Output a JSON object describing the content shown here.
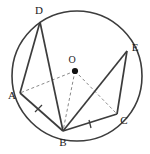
{
  "figure": {
    "background_color": "#ffffff",
    "stroke_color": "#3c3c3c",
    "dashed_color": "#8a8a8a",
    "label_color": "#1a1a1a",
    "circle": {
      "name": "circle-outline",
      "cx": 77,
      "cy": 76,
      "r": 65,
      "stroke_width": 1.6
    },
    "center_point": {
      "name": "center-point-o",
      "label": "O",
      "x": 75,
      "y": 71,
      "label_x": 72,
      "label_y": 61,
      "dot_radius": 3.1
    },
    "points": [
      {
        "id": "A",
        "label": "A",
        "x": 20,
        "y": 93,
        "label_x": 12,
        "label_y": 96
      },
      {
        "id": "B",
        "label": "B",
        "x": 63,
        "y": 131,
        "label_x": 63,
        "label_y": 143
      },
      {
        "id": "C",
        "label": "C",
        "x": 117,
        "y": 114,
        "label_x": 124,
        "label_y": 121
      },
      {
        "id": "D",
        "label": "D",
        "x": 40,
        "y": 22,
        "label_x": 39,
        "label_y": 11
      },
      {
        "id": "E",
        "label": "E",
        "x": 127,
        "y": 51,
        "label_x": 135,
        "label_y": 48
      }
    ],
    "chords": [
      {
        "name": "chord-d-a",
        "from": "D",
        "to": "A",
        "style": "solid"
      },
      {
        "name": "chord-d-b",
        "from": "D",
        "to": "B",
        "style": "solid"
      },
      {
        "name": "chord-a-b",
        "from": "A",
        "to": "B",
        "style": "solid"
      },
      {
        "name": "chord-b-c",
        "from": "B",
        "to": "C",
        "style": "solid"
      },
      {
        "name": "chord-b-e",
        "from": "B",
        "to": "E",
        "style": "solid"
      },
      {
        "name": "chord-c-e",
        "from": "C",
        "to": "E",
        "style": "solid"
      }
    ],
    "radii": [
      {
        "name": "radius-o-a",
        "from": "O",
        "to": "A",
        "style": "dashed"
      },
      {
        "name": "radius-o-b",
        "from": "O",
        "to": "B",
        "style": "dashed"
      },
      {
        "name": "radius-o-c",
        "from": "O",
        "to": "C",
        "style": "dashed"
      }
    ],
    "tick_marks": [
      {
        "name": "tick-mark-ab",
        "on_segment": "A-B",
        "x": 38,
        "y": 110,
        "angle": -55
      },
      {
        "name": "tick-mark-bc",
        "on_segment": "B-C",
        "x": 90,
        "y": 124,
        "angle": 70
      }
    ]
  }
}
